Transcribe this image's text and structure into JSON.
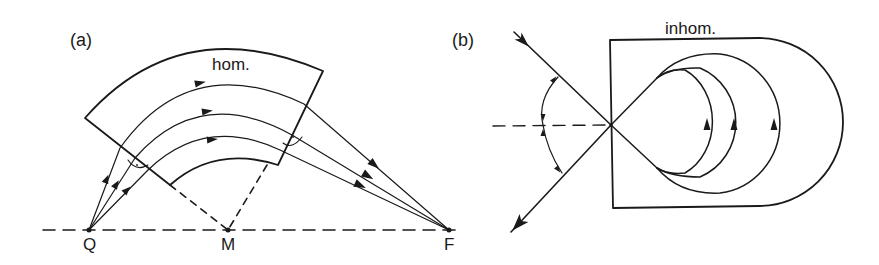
{
  "figure": {
    "panel_a": {
      "label": "(a)",
      "region_label": "hom.",
      "points": {
        "Q": "Q",
        "M": "M",
        "F": "F"
      }
    },
    "panel_b": {
      "label": "(b)",
      "region_label": "inhom."
    }
  },
  "colors": {
    "ink": "#1a1a1a",
    "background": "#ffffff"
  }
}
